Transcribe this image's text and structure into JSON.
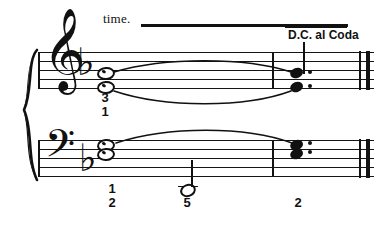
{
  "page": {
    "width": 389,
    "height": 226,
    "background": "#ffffff",
    "ink": "#111111"
  },
  "annotations": {
    "time_text": "time.",
    "dc_text": "D.C. al Coda"
  },
  "score": {
    "system": {
      "brace": "curly-brace",
      "staves": [
        {
          "name": "treble",
          "clef": "treble-clef",
          "clef_glyph": "𝄞",
          "key_signature": "one-flat",
          "key_signature_glyph": "♭"
        },
        {
          "name": "bass",
          "clef": "bass-clef",
          "clef_glyph": "𝄢",
          "key_signature": "one-flat",
          "key_signature_glyph": "♭"
        }
      ],
      "barlines": [
        "opening",
        "measure",
        "final-thin-thick"
      ]
    },
    "treble_notes": [
      {
        "id": "t-upper",
        "type": "whole",
        "x": 104,
        "y": 71,
        "tied": true
      },
      {
        "id": "t-lower",
        "type": "whole",
        "x": 104,
        "y": 85,
        "tied": true
      },
      {
        "id": "t-end-upper",
        "type": "filled",
        "x": 296,
        "y": 73,
        "dotted": true
      },
      {
        "id": "t-end-lower",
        "type": "filled",
        "x": 296,
        "y": 87,
        "dotted": true
      }
    ],
    "bass_notes": [
      {
        "id": "b-upper",
        "type": "whole",
        "x": 104,
        "y": 144,
        "tied": true
      },
      {
        "id": "b-lower",
        "type": "whole",
        "x": 104,
        "y": 153,
        "tied": true
      },
      {
        "id": "b-half",
        "type": "half",
        "x": 185,
        "y": 188,
        "stem": "up"
      },
      {
        "id": "b-end-upper",
        "type": "filled",
        "x": 296,
        "y": 145,
        "dotted": true
      },
      {
        "id": "b-end-lower",
        "type": "filled",
        "x": 296,
        "y": 154,
        "dotted": true
      }
    ],
    "fingerings": [
      {
        "value": "3",
        "x": 104,
        "y": 97,
        "staff": "treble"
      },
      {
        "value": "1",
        "x": 104,
        "y": 111,
        "staff": "treble"
      },
      {
        "value": "1",
        "x": 111,
        "y": 185,
        "staff": "bass"
      },
      {
        "value": "2",
        "x": 111,
        "y": 199,
        "staff": "bass"
      },
      {
        "value": "5",
        "x": 186,
        "y": 199,
        "staff": "bass"
      },
      {
        "value": "2",
        "x": 297,
        "y": 199,
        "staff": "bass"
      }
    ],
    "ties": [
      {
        "id": "tie-treble-upper",
        "from_x": 113,
        "to_x": 292,
        "y": 68,
        "bulge": -13
      },
      {
        "id": "tie-treble-lower",
        "from_x": 113,
        "to_x": 292,
        "y": 91,
        "bulge": 14
      },
      {
        "id": "tie-bass-upper",
        "from_x": 115,
        "to_x": 292,
        "y": 142,
        "bulge": -12
      }
    ]
  }
}
